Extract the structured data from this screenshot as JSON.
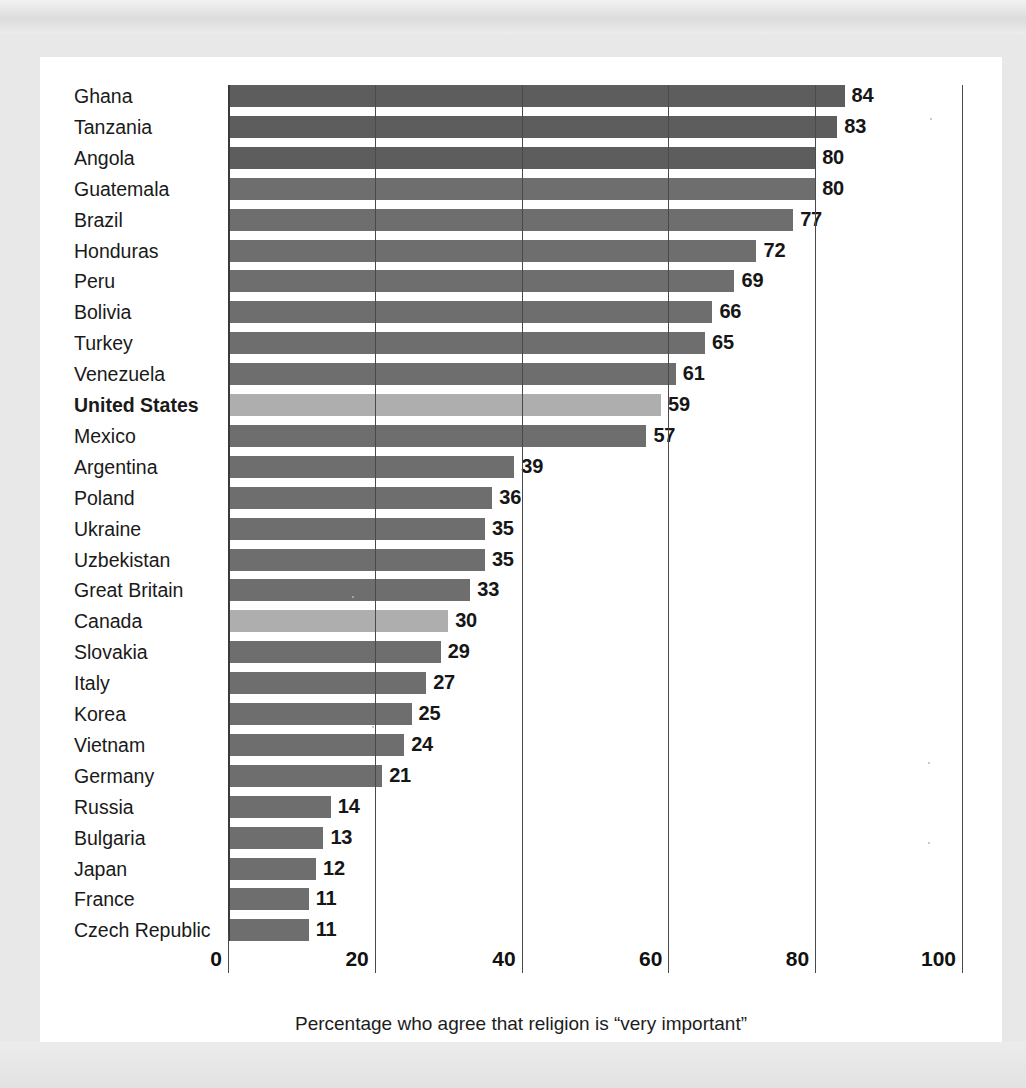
{
  "chart_data": {
    "type": "bar",
    "orientation": "horizontal",
    "title": "",
    "xlabel": "Percentage who agree that religion is “very important”",
    "ylabel": "",
    "xlim": [
      0,
      100
    ],
    "xticks": [
      "0",
      "20",
      "40",
      "60",
      "80",
      "100"
    ],
    "grid": true,
    "legend": "none",
    "categories": [
      "Ghana",
      "Tanzania",
      "Angola",
      "Guatemala",
      "Brazil",
      "Honduras",
      "Peru",
      "Bolivia",
      "Turkey",
      "Venezuela",
      "United States",
      "Mexico",
      "Argentina",
      "Poland",
      "Ukraine",
      "Uzbekistan",
      "Great Britain",
      "Canada",
      "Slovakia",
      "Italy",
      "Korea",
      "Vietnam",
      "Germany",
      "Russia",
      "Bulgaria",
      "Japan",
      "France",
      "Czech Republic"
    ],
    "values": [
      84,
      83,
      80,
      80,
      77,
      72,
      69,
      66,
      65,
      61,
      59,
      57,
      39,
      36,
      35,
      35,
      33,
      30,
      29,
      27,
      25,
      24,
      21,
      14,
      13,
      12,
      11,
      11
    ],
    "highlighted": [
      "United States",
      "Canada"
    ],
    "bold_labels": [
      "United States"
    ],
    "colors": {
      "bar": "#6e6e6e",
      "bar_dark": "#5d5d5d",
      "bar_highlight": "#aeaeae",
      "axis": "#4a4a4a",
      "text": "#1a1a1a",
      "card": "#ffffff",
      "page": "#e8e8e8"
    },
    "bars": [
      {
        "label": "Ghana",
        "value": 84,
        "shade": "dark"
      },
      {
        "label": "Tanzania",
        "value": 83,
        "shade": "dark"
      },
      {
        "label": "Angola",
        "value": 80,
        "shade": "dark"
      },
      {
        "label": "Guatemala",
        "value": 80,
        "shade": "normal"
      },
      {
        "label": "Brazil",
        "value": 77,
        "shade": "normal"
      },
      {
        "label": "Honduras",
        "value": 72,
        "shade": "normal"
      },
      {
        "label": "Peru",
        "value": 69,
        "shade": "normal"
      },
      {
        "label": "Bolivia",
        "value": 66,
        "shade": "normal"
      },
      {
        "label": "Turkey",
        "value": 65,
        "shade": "normal"
      },
      {
        "label": "Venezuela",
        "value": 61,
        "shade": "normal"
      },
      {
        "label": "United States",
        "value": 59,
        "shade": "highlight"
      },
      {
        "label": "Mexico",
        "value": 57,
        "shade": "normal"
      },
      {
        "label": "Argentina",
        "value": 39,
        "shade": "normal"
      },
      {
        "label": "Poland",
        "value": 36,
        "shade": "normal"
      },
      {
        "label": "Ukraine",
        "value": 35,
        "shade": "normal"
      },
      {
        "label": "Uzbekistan",
        "value": 35,
        "shade": "normal"
      },
      {
        "label": "Great Britain",
        "value": 33,
        "shade": "normal"
      },
      {
        "label": "Canada",
        "value": 30,
        "shade": "highlight"
      },
      {
        "label": "Slovakia",
        "value": 29,
        "shade": "normal"
      },
      {
        "label": "Italy",
        "value": 27,
        "shade": "normal"
      },
      {
        "label": "Korea",
        "value": 25,
        "shade": "normal"
      },
      {
        "label": "Vietnam",
        "value": 24,
        "shade": "normal"
      },
      {
        "label": "Germany",
        "value": 21,
        "shade": "normal"
      },
      {
        "label": "Russia",
        "value": 14,
        "shade": "normal"
      },
      {
        "label": "Bulgaria",
        "value": 13,
        "shade": "normal"
      },
      {
        "label": "Japan",
        "value": 12,
        "shade": "normal"
      },
      {
        "label": "France",
        "value": 11,
        "shade": "normal"
      },
      {
        "label": "Czech Republic",
        "value": 11,
        "shade": "normal"
      }
    ]
  }
}
